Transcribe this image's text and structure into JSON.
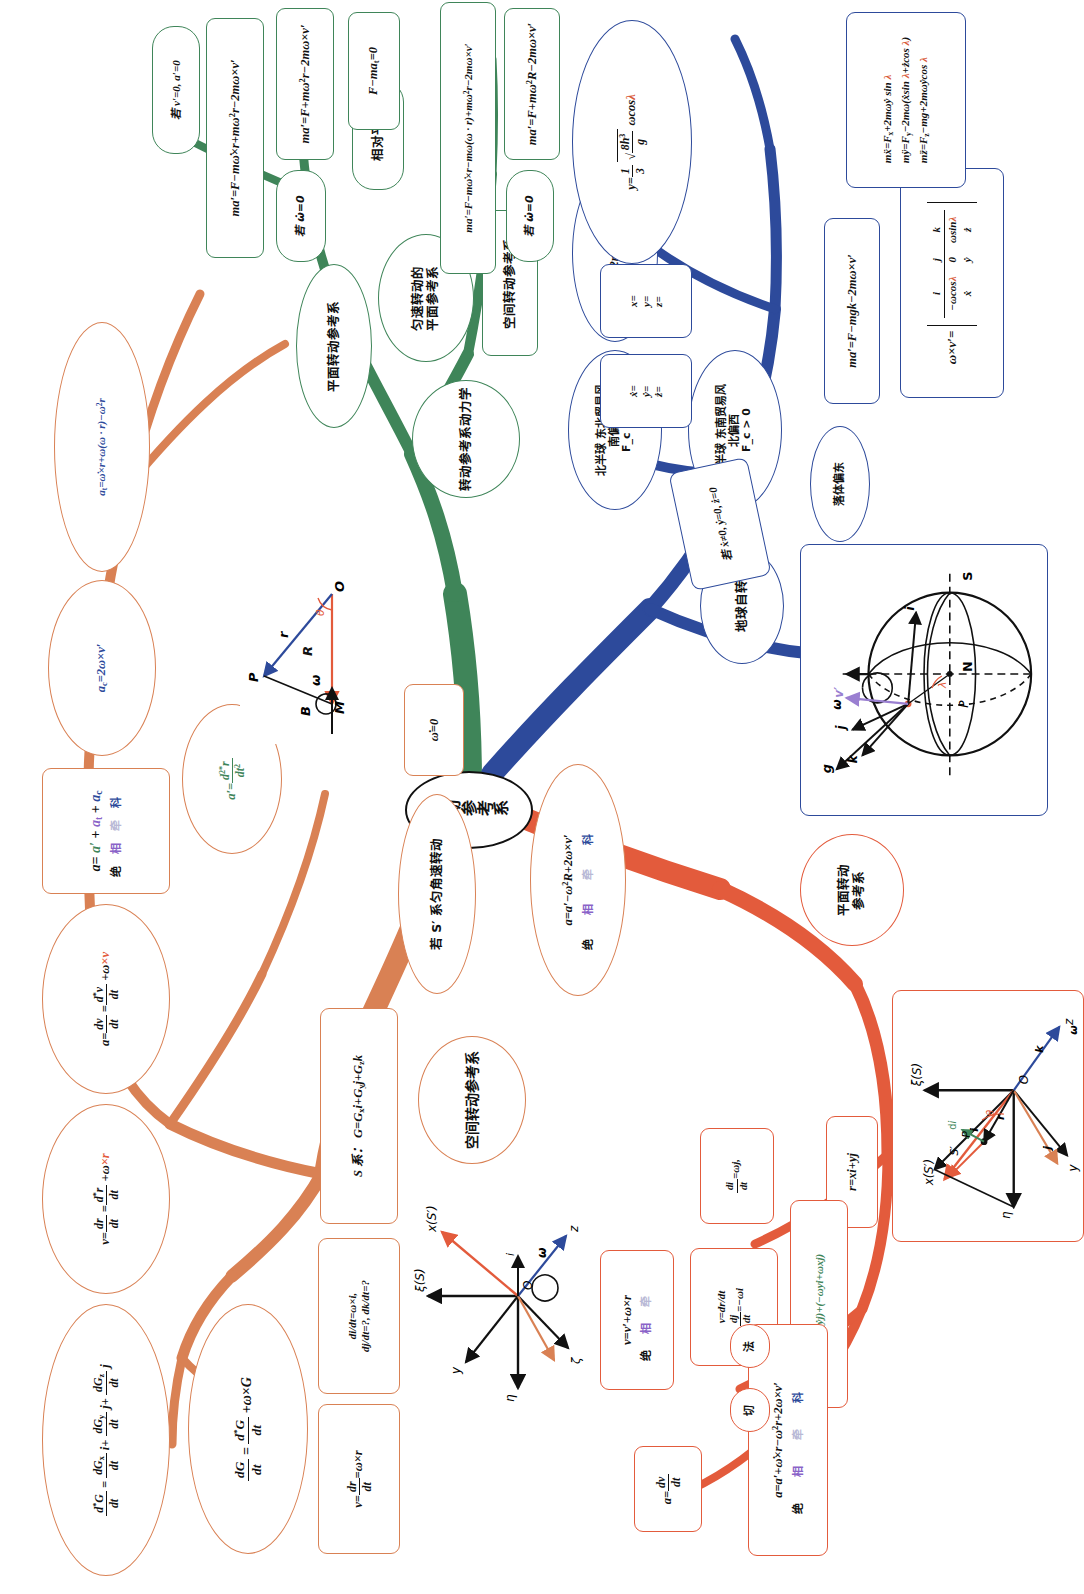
{
  "meta": {
    "colors": {
      "orange": "#d98154",
      "green": "#3f8559",
      "red": "#e35b3c",
      "blue": "#2d4a9b",
      "black": "#111111",
      "lambda_red": "#d95b3c",
      "relative_purple": "#8a63c8",
      "towing_grey": "#b9b9d6"
    }
  },
  "center": {
    "label": "转动参考系"
  },
  "orange_branch": {
    "name": "空间转动参考系",
    "nodes": {
      "dG_expand": "d*G/dt = dGx/dt i + dGy/dt j + dGz/dt k",
      "v_transform": "v = dr/dt = d*r/dt + ω×r",
      "a_transform": "a = dv/dt = d*v/dt + ω×v",
      "a_decomp_main": "a = a′ + a_t + a_c",
      "a_decomp_labels": [
        "绝",
        "相",
        "牵",
        "科"
      ],
      "a_c": "a_c = 2ω×v′",
      "a_t_branch": "a_t = ω̇×r + ω(ω · r) − ω²r",
      "a_prime": "a′ = d²*r/dt²",
      "dG_main": "dG/dt = d*G/dt + ω×G",
      "dv_omega_r": "v = dr/dt = ω×r",
      "di_dj_dk": "di/dt = ω×i, dj/dt = ?, dk/dt = ?",
      "S_frame": "S 系： G = Gx i + Gy j + Gz k",
      "space_frame": "空间转动参考系",
      "uniform_cond": "若 S′ 系匀角速转动",
      "omega_dot_zero": "ω̇ = 0",
      "plane_a": "a = a′ − ω²R + 2ω×v′",
      "plane_a_labels": [
        "绝",
        "相",
        "牵",
        "科"
      ]
    }
  },
  "green_branch": {
    "name": "转动参考系动力学",
    "nodes": {
      "dyn_center": "转动参考系动力学",
      "plane_frame": "平面转动参考系",
      "uniform_plane_frame": "匀速转动的\n平面参考系",
      "space_frame": "空间转动参考系",
      "eq_plane_full": "ma′ = F − mω̇×r + mω²r − 2mω×v′",
      "cond_omega_dot_0": "若 ω̇ = 0",
      "eq_plane_uniform": "ma′ = F + mω²r − 2mω×v′",
      "eq_space_full": "ma′ = F − mω̇×r − mω(ω · r) + mω²r − 2mω×v′",
      "eq_space_uniform": "ma′ = F + mω²R − 2mω×v′",
      "cond_omega_dot_0b": "若 ω̇ = 0",
      "relative_equilibrium": "相对平衡",
      "cond_v_a_zero": "若 v′ = 0, a′ = 0",
      "eq_equilibrium": "F − ma_t = 0"
    }
  },
  "red_branch": {
    "name": "平面转动参考系",
    "nodes": {
      "plane_frame": "平面转动\n参考系",
      "r_def": "r = x i + y j",
      "di_dt": "di/dt = ω j,",
      "dj_dt": "v = dr/dt\ndj/dt = −ω i",
      "v_expand": "v = (ẋ i + ẏ j) + (−ω y i + ω x j)",
      "v_result": "v = v′ + ω×r",
      "v_result_labels": [
        "绝",
        "相",
        "牵"
      ],
      "a_def": "a = dv/dt",
      "a_result": "a = a′ + ω̇×r − ω²r + 2ω×v′",
      "a_result_labels": [
        "绝",
        "相",
        "牵",
        "科"
      ],
      "tangent": "切",
      "normal": "法",
      "diagram_labels": [
        "x(S′)",
        "ξ(S)",
        "η",
        "y",
        "z",
        "O",
        "P",
        "S′",
        "r",
        "i",
        "j",
        "k",
        "ω",
        "θ",
        "di"
      ]
    }
  },
  "blue_branch": {
    "name": "地球自转",
    "nodes": {
      "earth_rotation": "地球自转",
      "north_hemisphere": "北半球 东北贸易风\n南偏西\nF_c < 0",
      "coriolis_force": "F_c = −2mωẋ sin λ j",
      "south_hemisphere": "南半球 东南贸易风\n北偏西\nF_c > 0",
      "falling_east": "落体偏东",
      "cond_fall": "若 ẋ ≠ 0, ẏ = 0, ż = 0",
      "eq_motion": "ma′ = F − mg k − 2mω×v′",
      "determinant_head": [
        "i",
        "j",
        "k"
      ],
      "determinant_row1": [
        "−ω cos λ",
        "0",
        "ω sin λ"
      ],
      "determinant_row2": [
        "ẋ",
        "ẏ",
        "ż"
      ],
      "determinant_lhs": "ω×v′ =",
      "scalar_eqs": [
        "mẍ = F_x + 2mωẏ sin λ",
        "mÿ = F_y − 2mω(ẋ sin λ + ż cos λ)",
        "mz̈ = F_z − mg + 2mωẏ cos λ"
      ],
      "first_integrals": "ẋ =\nẏ =\nż =",
      "second_integrals": "x =\ny =\nz =",
      "deflection": "y = (1/3) √(8h³/g) ω cos λ",
      "earth_diagram_labels": [
        "N",
        "S",
        "ω",
        "P",
        "λ",
        "g",
        "k",
        "j",
        "i",
        "v′"
      ]
    }
  }
}
